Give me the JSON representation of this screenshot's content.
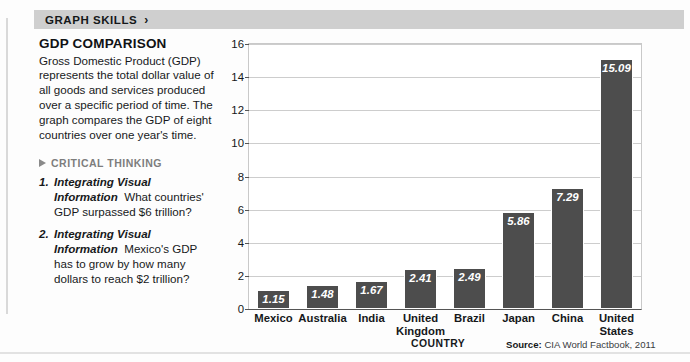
{
  "header": {
    "title": "GRAPH SKILLS",
    "chevron_icon": "chevron-right-icon",
    "chevron_glyph": "›",
    "band_color": "#cfcfcf"
  },
  "sidebar": {
    "title": "GDP COMPARISON",
    "body": "Gross Domestic Product (GDP) represents the total dollar value of all goods and services produced over a specific period of time. The graph compares the GDP of eight countries over one year's time.",
    "critical_thinking": {
      "label": "CRITICAL THINKING",
      "triangle_icon": "triangle-right-icon",
      "label_color": "#7d7d7d"
    },
    "questions": [
      {
        "number": "1.",
        "lead": "Integrating Visual Information",
        "text": "What countries' GDP surpassed $6 trillion?"
      },
      {
        "number": "2.",
        "lead": "Integrating Visual Information",
        "text": "Mexico's GDP has to grow by how many dollars to reach $2 trillion?"
      }
    ]
  },
  "chart_data": {
    "type": "bar",
    "title": "GDP COMPARISON",
    "xlabel": "COUNTRY",
    "ylabel": "U.S. DOLLARS (IN TRILLIONS)",
    "categories": [
      "Mexico",
      "Australia",
      "India",
      "United Kingdom",
      "Brazil",
      "Japan",
      "China",
      "United States"
    ],
    "values": [
      1.15,
      1.48,
      1.67,
      2.41,
      2.49,
      5.86,
      7.29,
      15.09
    ],
    "value_labels": [
      "1.15",
      "1.48",
      "1.67",
      "2.41",
      "2.49",
      "5.86",
      "7.29",
      "15.09"
    ],
    "ylim": [
      0,
      16
    ],
    "yticks": [
      0,
      2,
      4,
      6,
      8,
      10,
      12,
      14,
      16
    ],
    "ytick_labels": [
      "0",
      "2",
      "4",
      "6",
      "8",
      "10",
      "12",
      "14",
      "16"
    ],
    "grid": true,
    "legend": false,
    "bar_color": "#4d4d4d",
    "value_label_color": "#ffffff"
  },
  "footer": {
    "source_prefix": "Source:",
    "source_text": "CIA World Factbook, 2011"
  }
}
